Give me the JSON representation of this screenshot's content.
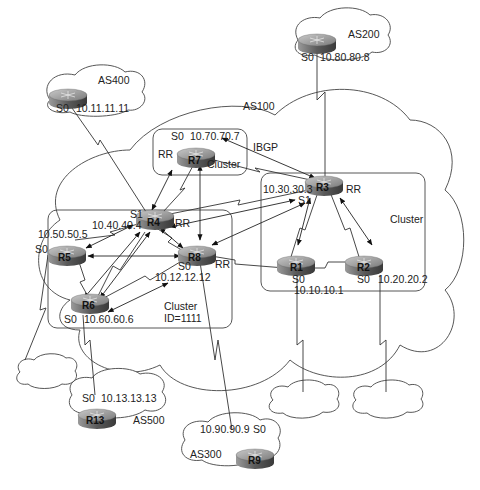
{
  "diagram": {
    "autonomous_systems": {
      "as100": "AS100",
      "as200": "AS200",
      "as300": "AS300",
      "as400": "AS400",
      "as500": "AS500"
    },
    "routers": {
      "r1": {
        "name": "R1",
        "iface": "S0",
        "ip": "10.10.10.1"
      },
      "r2": {
        "name": "R2",
        "iface": "S0",
        "ip": "10.20.20.2"
      },
      "r3": {
        "name": "R3",
        "iface": "S1",
        "ip": "10.30.30.3",
        "role": "RR"
      },
      "r4": {
        "name": "R4",
        "iface": "S1",
        "ip": "10.40.40.4",
        "role": "RR"
      },
      "r5": {
        "name": "R5",
        "iface": "S0",
        "ip": "10.50.50.5"
      },
      "r6": {
        "name": "R6",
        "iface": "S0",
        "ip": "10.60.60.6"
      },
      "r7": {
        "name": "R7",
        "iface": "S0",
        "ip": "10.70.70.7",
        "role": "RR"
      },
      "r8": {
        "name": "R8",
        "iface": "S0",
        "ip": "10.12.12.12",
        "role": "RR"
      },
      "r9": {
        "name": "R9",
        "iface": "S0",
        "ip": "10.90.90.9"
      },
      "r13": {
        "name": "R13",
        "iface": "S0",
        "ip": "10.13.13.13"
      },
      "as400_router": {
        "iface": "S0",
        "ip": "10.11.11.11"
      },
      "as200_router": {
        "iface": "S0",
        "ip": "10.80.80.8"
      }
    },
    "clusters": {
      "r7_cluster": "Cluster",
      "r3_cluster": "Cluster",
      "r4_cluster_line1": "Cluster",
      "r4_cluster_line2": "ID=1111"
    },
    "labels": {
      "ibgp": "IBGP"
    }
  }
}
